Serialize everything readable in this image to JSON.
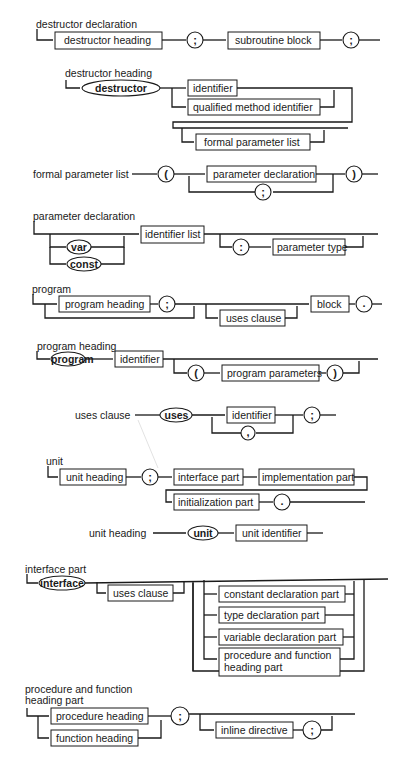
{
  "page": {
    "header_fragment": "...pp...",
    "accent_color": "#1a1a1a"
  },
  "diagrams": {
    "destructor_declaration": {
      "title": "destructor declaration",
      "nodes": [
        "destructor heading",
        ";",
        "subroutine block",
        ";"
      ]
    },
    "destructor_heading": {
      "title": "destructor heading",
      "keyword": "destructor",
      "nodes": [
        "identifier",
        "qualified method identifier",
        "formal parameter list"
      ]
    },
    "formal_parameter_list": {
      "title": "formal parameter list",
      "nodes": [
        "(",
        "parameter declaration",
        ";",
        ")"
      ]
    },
    "parameter_declaration": {
      "title": "parameter declaration",
      "keywords": [
        "var",
        "const"
      ],
      "nodes": [
        "identifier list",
        ":",
        "parameter type"
      ]
    },
    "program": {
      "title": "program",
      "nodes": [
        "program heading",
        ";",
        "uses clause",
        "block",
        "."
      ]
    },
    "program_heading": {
      "title": "program heading",
      "keyword": "program",
      "nodes": [
        "identifier",
        "(",
        "program parameters",
        ")"
      ]
    },
    "uses_clause": {
      "title": "uses clause",
      "keyword": "uses",
      "nodes": [
        "identifier",
        ",",
        ";"
      ]
    },
    "unit": {
      "title": "unit",
      "nodes": [
        "unit heading",
        ";",
        "interface part",
        "implementation part",
        "initialization part",
        "."
      ]
    },
    "unit_heading": {
      "title": "unit heading",
      "keyword": "unit",
      "nodes": [
        "unit identifier"
      ]
    },
    "interface_part": {
      "title": "interface part",
      "keyword": "interface",
      "nodes": [
        "uses clause",
        "constant declaration part",
        "type declaration part",
        "variable declaration part",
        "procedure and function",
        "heading part"
      ]
    },
    "procedure_and_function_heading_part": {
      "title_line1": "procedure and function",
      "title_line2": "heading part",
      "nodes": [
        "procedure heading",
        "function heading",
        ";",
        "inline directive",
        ";"
      ]
    }
  }
}
